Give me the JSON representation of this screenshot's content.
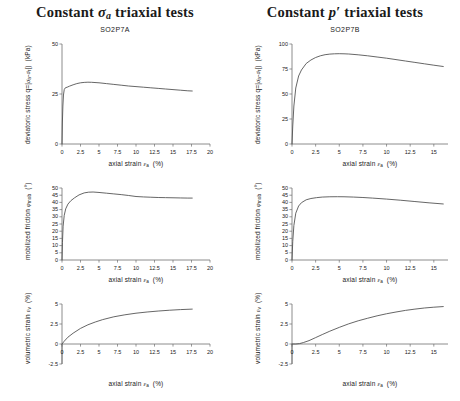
{
  "figure": {
    "width": 460,
    "height": 401,
    "background": "#ffffff",
    "curve_color": "#4a4a4a",
    "axis_color": "#6e6e6e"
  },
  "columns": [
    {
      "key": "left",
      "title_prefix": "Constant",
      "title_symbol": "σ",
      "title_symbol_sub": "a",
      "title_suffix": "triaxial tests",
      "sample_id": "SO2P7A"
    },
    {
      "key": "right",
      "title_prefix": "Constant",
      "title_symbol": "p′",
      "title_symbol_sub": "",
      "title_suffix": "triaxial tests",
      "sample_id": "SO2P7B"
    }
  ],
  "axis_labels": {
    "deviatoric_stress": "deviatoric stress q=|σa-σr|) (kPa)",
    "mobilized_friction": "mobilized friction φmob (°)",
    "volumetric_strain": "volumetric strain εv (%)",
    "axial_strain": "axial strain εa (%)"
  },
  "chart_data": [
    {
      "id": "left-deviatoric-stress",
      "type": "line",
      "title": "Constant σa triaxial tests",
      "subtitle": "SO2P7A",
      "xlabel": "axial strain εa (%)",
      "ylabel": "deviatoric stress q=|σa-σr|) (kPa)",
      "xlim": [
        0,
        20
      ],
      "ylim": [
        0,
        50
      ],
      "xticks": [
        0,
        2.5,
        5,
        7.5,
        10,
        12.5,
        15,
        17.5,
        20
      ],
      "xticklabels": [
        "0",
        "2.5",
        "5",
        "7.5",
        "10",
        "12.5",
        "15",
        "17.5",
        "20"
      ],
      "yticks": [
        0,
        25,
        50
      ],
      "yticklabels": [
        "0",
        "25",
        "50"
      ],
      "grid": false,
      "legend": "none",
      "x": [
        0,
        0.05,
        0.12,
        0.2,
        0.3,
        0.45,
        0.7,
        1.0,
        1.5,
        2.0,
        2.5,
        3.0,
        3.5,
        4.0,
        5.0,
        6.0,
        7.0,
        8.0,
        9.0,
        10.0,
        11.0,
        12.0,
        13.0,
        14.0,
        15.0,
        16.0,
        17.0,
        17.6
      ],
      "y": [
        0,
        10.5,
        19.0,
        24.5,
        27.2,
        28.1,
        28.4,
        28.9,
        29.6,
        30.2,
        30.6,
        30.8,
        30.9,
        30.85,
        30.6,
        30.2,
        29.8,
        29.4,
        29.0,
        28.7,
        28.4,
        28.1,
        27.8,
        27.5,
        27.2,
        26.9,
        26.6,
        26.5
      ]
    },
    {
      "id": "left-mobilized-friction",
      "type": "line",
      "xlabel": "axial strain εa (%)",
      "ylabel": "mobilized friction φmob (°)",
      "xlim": [
        0,
        20
      ],
      "ylim": [
        0,
        50
      ],
      "xticks": [
        0,
        2.5,
        5,
        7.5,
        10,
        12.5,
        15,
        17.5,
        20
      ],
      "xticklabels": [
        "0",
        "2.5",
        "5",
        "7.5",
        "10",
        "12.5",
        "15",
        "17.5",
        "20"
      ],
      "yticks": [
        0,
        5,
        10,
        15,
        20,
        25,
        30,
        35,
        40,
        45,
        50
      ],
      "yticklabels": [
        "0",
        "5",
        "10",
        "15",
        "20",
        "25",
        "30",
        "35",
        "40",
        "45",
        "50"
      ],
      "grid": false,
      "legend": "none",
      "x": [
        0,
        0.06,
        0.15,
        0.3,
        0.5,
        0.8,
        1.2,
        1.7,
        2.3,
        3.0,
        3.6,
        4.2,
        5.0,
        6.0,
        7.0,
        8.0,
        9.0,
        10.0,
        11.0,
        12.0,
        13.0,
        14.0,
        15.0,
        16.0,
        17.0,
        17.6
      ],
      "y": [
        0,
        12.0,
        23.5,
        31.0,
        35.5,
        38.8,
        41.2,
        43.2,
        45.2,
        46.6,
        47.1,
        47.2,
        46.9,
        46.4,
        45.9,
        45.4,
        44.8,
        44.1,
        43.8,
        43.6,
        43.4,
        43.3,
        43.2,
        43.1,
        43.0,
        43.0
      ]
    },
    {
      "id": "left-volumetric-strain",
      "type": "line",
      "xlabel": "axial strain εa (%)",
      "ylabel": "volumetric strain εv (%)",
      "xlim": [
        0,
        20
      ],
      "ylim": [
        -2.5,
        5
      ],
      "xticks": [
        0,
        2.5,
        5,
        7.5,
        10,
        12.5,
        15,
        17.5,
        20
      ],
      "xticklabels": [
        "0",
        "2.5",
        "5",
        "7.5",
        "10",
        "12.5",
        "15",
        "17.5",
        "20"
      ],
      "yticks": [
        -2.5,
        0,
        2.5,
        5
      ],
      "yticklabels": [
        "-2.5",
        "0",
        "2.5",
        "5"
      ],
      "grid": false,
      "legend": "none",
      "x": [
        0,
        0.3,
        0.8,
        1.5,
        2.5,
        3.5,
        4.5,
        5.5,
        7.0,
        8.5,
        10.0,
        11.5,
        13.0,
        14.5,
        16.0,
        17.6
      ],
      "y": [
        0,
        0.35,
        0.85,
        1.35,
        1.95,
        2.4,
        2.75,
        3.05,
        3.4,
        3.65,
        3.85,
        4.0,
        4.12,
        4.22,
        4.3,
        4.36
      ]
    },
    {
      "id": "right-deviatoric-stress",
      "type": "line",
      "title": "Constant p′ triaxial tests",
      "subtitle": "SO2P7B",
      "xlabel": "axial strain εa (%)",
      "ylabel": "deviatoric stress q=|σa-σr|) (kPa)",
      "xlim": [
        0,
        16.5
      ],
      "ylim": [
        0,
        100
      ],
      "xticks": [
        0,
        2.5,
        5,
        7.5,
        10,
        12.5,
        15
      ],
      "xticklabels": [
        "0",
        "2.5",
        "5",
        "7.5",
        "10",
        "12.5",
        "15"
      ],
      "yticks": [
        0,
        25,
        50,
        75,
        100
      ],
      "yticklabels": [
        "0",
        "25",
        "50",
        "75",
        "100"
      ],
      "grid": false,
      "legend": "none",
      "x": [
        0,
        0.08,
        0.2,
        0.4,
        0.7,
        1.0,
        1.5,
        2.0,
        2.5,
        3.0,
        3.5,
        4.0,
        4.5,
        5.0,
        5.5,
        6.0,
        7.0,
        8.0,
        9.0,
        10.0,
        11.0,
        12.0,
        13.0,
        14.0,
        15.0,
        16.0
      ],
      "y": [
        0,
        18.0,
        38.0,
        56.0,
        68.0,
        74.0,
        80.5,
        84.0,
        86.5,
        88.2,
        89.3,
        89.9,
        90.2,
        90.3,
        90.2,
        90.0,
        89.2,
        88.2,
        87.0,
        85.8,
        84.4,
        83.0,
        81.6,
        80.2,
        78.8,
        77.5
      ]
    },
    {
      "id": "right-mobilized-friction",
      "type": "line",
      "xlabel": "axial strain εa (%)",
      "ylabel": "mobilized friction φmob (°)",
      "xlim": [
        0,
        16.5
      ],
      "ylim": [
        0,
        50
      ],
      "xticks": [
        0,
        2.5,
        5,
        7.5,
        10,
        12.5,
        15
      ],
      "xticklabels": [
        "0",
        "2.5",
        "5",
        "7.5",
        "10",
        "12.5",
        "15"
      ],
      "yticks": [
        0,
        5,
        10,
        15,
        20,
        25,
        30,
        35,
        40,
        45,
        50
      ],
      "yticklabels": [
        "0",
        "5",
        "10",
        "15",
        "20",
        "25",
        "30",
        "35",
        "40",
        "45",
        "50"
      ],
      "grid": false,
      "legend": "none",
      "x": [
        0,
        0.08,
        0.2,
        0.4,
        0.7,
        1.0,
        1.5,
        2.0,
        2.6,
        3.2,
        4.0,
        4.8,
        5.5,
        6.5,
        7.5,
        8.5,
        10.0,
        11.5,
        13.0,
        14.5,
        16.0
      ],
      "y": [
        0,
        13.0,
        24.0,
        32.5,
        37.5,
        39.8,
        41.8,
        42.7,
        43.3,
        43.7,
        43.9,
        43.95,
        43.9,
        43.7,
        43.4,
        43.0,
        42.3,
        41.5,
        40.6,
        39.7,
        38.9
      ]
    },
    {
      "id": "right-volumetric-strain",
      "type": "line",
      "xlabel": "axial strain εa (%)",
      "ylabel": "volumetric strain εv (%)",
      "xlim": [
        0,
        16.5
      ],
      "ylim": [
        -2.5,
        5
      ],
      "xticks": [
        0,
        2.5,
        5,
        7.5,
        10,
        12.5,
        15
      ],
      "xticklabels": [
        "0",
        "2.5",
        "5",
        "7.5",
        "10",
        "12.5",
        "15"
      ],
      "yticks": [
        -2.5,
        0,
        2.5,
        5
      ],
      "yticklabels": [
        "-2.5",
        "0",
        "2.5",
        "5"
      ],
      "grid": false,
      "legend": "none",
      "x": [
        0,
        0.4,
        0.8,
        1.2,
        1.8,
        2.5,
        3.2,
        4.0,
        5.0,
        6.0,
        7.0,
        8.0,
        9.0,
        10.0,
        11.0,
        12.0,
        13.0,
        14.0,
        15.0,
        16.0
      ],
      "y": [
        0,
        0.0,
        0.05,
        0.18,
        0.42,
        0.8,
        1.18,
        1.6,
        2.08,
        2.52,
        2.9,
        3.22,
        3.52,
        3.78,
        4.0,
        4.2,
        4.36,
        4.5,
        4.6,
        4.68
      ]
    }
  ]
}
